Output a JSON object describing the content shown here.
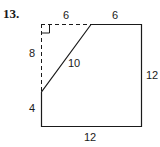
{
  "problem": {
    "number": "13."
  },
  "figure": {
    "labels": {
      "top_left_segment": "6",
      "top_right_segment": "6",
      "left_upper_dashed": "8",
      "diagonal": "10",
      "left_lower": "4",
      "right_side": "12",
      "bottom_side": "12"
    },
    "colors": {
      "stroke": "#1a1a1a",
      "background": "#ffffff"
    }
  }
}
